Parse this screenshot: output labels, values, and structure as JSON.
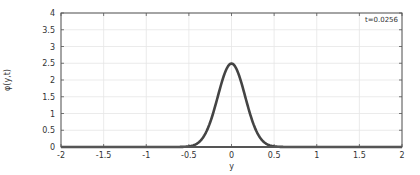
{
  "chart_data": {
    "type": "line",
    "title": "",
    "xlabel": "y",
    "ylabel": "φ(y,t)",
    "xlim": [
      -2,
      2
    ],
    "ylim": [
      0,
      4
    ],
    "xticks": [
      -2,
      -1.5,
      -1,
      -0.5,
      0,
      0.5,
      1,
      1.5,
      2
    ],
    "xtick_labels": [
      "-2",
      "-1.5",
      "-1",
      "-0.5",
      "0",
      "0.5",
      "1",
      "1.5",
      "2"
    ],
    "yticks": [
      0,
      0.5,
      1,
      1.5,
      2,
      2.5,
      3,
      3.5,
      4
    ],
    "ytick_labels": [
      "0",
      "0.5",
      "1",
      "1.5",
      "2",
      "2.5",
      "3",
      "3.5",
      "4"
    ],
    "grid": true,
    "legend": null,
    "annotation": "t=0.0256",
    "series": [
      {
        "name": "φ(y,t)",
        "color": "#444444",
        "x": [
          -2,
          -1,
          -0.6,
          -0.5,
          -0.45,
          -0.4,
          -0.35,
          -0.3,
          -0.25,
          -0.2,
          -0.15,
          -0.1,
          -0.05,
          0,
          0.05,
          0.1,
          0.15,
          0.2,
          0.25,
          0.3,
          0.35,
          0.4,
          0.45,
          0.5,
          0.6,
          1,
          2
        ],
        "y": [
          0,
          0,
          0.002,
          0.018,
          0.048,
          0.11,
          0.23,
          0.43,
          0.72,
          1.09,
          1.53,
          1.96,
          2.31,
          2.49,
          2.31,
          1.96,
          1.53,
          1.09,
          0.72,
          0.43,
          0.23,
          0.11,
          0.048,
          0.018,
          0.002,
          0,
          0
        ]
      }
    ]
  },
  "colors": {
    "line": "#444444",
    "axis": "#555555",
    "grid": "#e6e6e6",
    "background": "#ffffff"
  }
}
